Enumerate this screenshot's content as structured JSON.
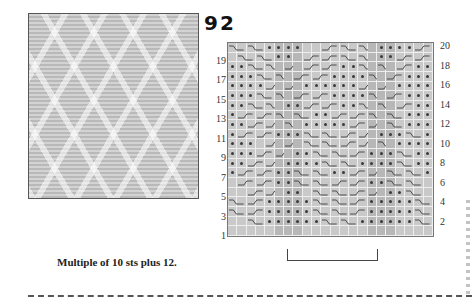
{
  "pattern": {
    "number": "92",
    "caption": "Multiple of 10 sts plus 12."
  },
  "chart": {
    "columns": 22,
    "rows": 20,
    "left_row_labels": [
      "19",
      "17",
      "15",
      "13",
      "11",
      "9",
      "7",
      "5",
      "3",
      "1"
    ],
    "right_row_labels": [
      "20",
      "18",
      "16",
      "14",
      "12",
      "10",
      "8",
      "6",
      "4",
      "2"
    ],
    "legend_symbols": {
      ".": "blank (knit on RS)",
      "o": "dot (purl on RS)",
      "R": "right cross cable (2 sts)",
      "L": "left cross cable (2 sts)"
    },
    "repeat_bracket": "10 sts",
    "colors": {
      "grid_bg": "#c9c9c9",
      "shade": "#b7b7b7",
      "gridline": "#eeeeee",
      "symbol": "#3a3a3a"
    },
    "grid_rows_top_to_bottom": [
      "R.R.oooo..L.R.R.ooooL.R.",
      ".R.R.oo.L.L.R.R.ooL.L.",
      "ooR.R.L.L.L.ooR.R.L.oo",
      "oooR.R.L.L.ooooR.L.ooo",
      "ooooL.L.ooooooL.L.oooo",
      "oooR.R.L.L.ooooR.L.ooo",
      "ooR.R.ooL.L.ooR.R.L.oo",
      "oL.L.R.R.ooL.L.R.R.ooo",
      "ooL.L.R.oooooL.L.R.ooo",
      "oL.L.oooR.R.L.L.oooR.o",
      "ooo.L.L.R.R.L.L.R.oooo",
      "oooL.L.ooR.R.L.oooR.oo",
      "ooL.L.ooooR.R.ooooR.oo",
      "oL.L.ooR.R.ooL.L.R.R.o",
      ".L.L.ooR.R.L.L.ooR.R..",
      "..L.L.oo.R.R.L.L.ooR.R",
      "R.L.oooooR.R.L.oooooR.",
      "R.L.oooooR.R.L.oooooR.",
      "..R.ooooooR.R.ooooooR.",
      "......................"
    ]
  }
}
